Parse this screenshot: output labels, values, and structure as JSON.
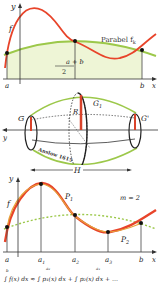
{
  "panel1": {
    "y_label": "y",
    "x_label": "x",
    "f_label": "f",
    "parabola_label": "Parabel f",
    "parabola_sub": "k",
    "mid_num": "a + b",
    "mid_den": "2",
    "a_label": "a",
    "b_label": "b",
    "colors": {
      "curve": "#e8442a",
      "parabola": "#9cc84a",
      "fill": "#eef5d6"
    }
  },
  "panel2": {
    "G_label": "G",
    "G1_label": "G",
    "G1_sub": "1",
    "Gp_label": "G'",
    "R_label": "R",
    "y_label": "y",
    "H_label": "H",
    "annotation": "Anslow 1615",
    "colors": {
      "profile": "#9cc84a",
      "radius": "#d9432b"
    }
  },
  "panel3": {
    "y_label": "y",
    "x_label": "x",
    "f_label": "f",
    "P1_label": "P",
    "P1_sub": "1",
    "P2_label": "P",
    "P2_sub": "2",
    "m_label": "m = 2",
    "ticks": [
      "a",
      "a",
      "a",
      "a",
      "b"
    ],
    "tick_subs": [
      "",
      "1",
      "2",
      "3",
      ""
    ],
    "colors": {
      "curve": "#e8442a",
      "overlay": "#e6a23a",
      "parabola": "#9cc84a"
    }
  },
  "formula": {
    "text": "∫ f(x) dx ≈ ∫ p₁(x) dx + ∫ p₂(x) dx + …",
    "limits": [
      "b",
      "a₂",
      "a₄"
    ]
  }
}
